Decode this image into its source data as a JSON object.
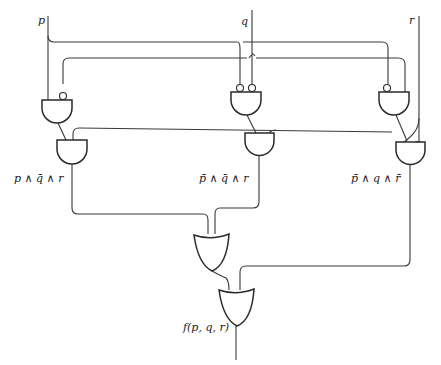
{
  "diagram": {
    "type": "logic-circuit",
    "inputs": [
      {
        "id": "p",
        "label": "p"
      },
      {
        "id": "q",
        "label": "q"
      },
      {
        "id": "r",
        "label": "r"
      }
    ],
    "gates": [
      {
        "id": "and1a",
        "type": "AND",
        "inputs": [
          "p",
          "not q"
        ]
      },
      {
        "id": "and1b",
        "type": "AND",
        "inputs": [
          "and1a",
          "r"
        ],
        "output_label": "p ∧ q̄ ∧ r"
      },
      {
        "id": "and2a",
        "type": "AND",
        "inputs": [
          "not p",
          "not q"
        ]
      },
      {
        "id": "and2b",
        "type": "AND",
        "inputs": [
          "and2a",
          "r"
        ],
        "output_label": "p̄ ∧ q̄ ∧ r"
      },
      {
        "id": "and3a",
        "type": "AND",
        "inputs": [
          "not p",
          "q"
        ]
      },
      {
        "id": "and3b",
        "type": "AND",
        "inputs": [
          "and3a",
          "not r"
        ],
        "output_label": "p̄ ∧ q ∧ r̄"
      },
      {
        "id": "or1",
        "type": "OR",
        "inputs": [
          "and1b",
          "and2b"
        ]
      },
      {
        "id": "or2",
        "type": "OR",
        "inputs": [
          "or1",
          "and3b"
        ],
        "output_label": "f(p, q, r)"
      }
    ]
  },
  "labels": {
    "p": "p",
    "q": "q",
    "r": "r",
    "term1": "p ∧ q̄ ∧ r",
    "term2": "p̄ ∧ q̄ ∧ r",
    "term3": "p̄ ∧ q ∧ r̄",
    "output": "f(p, q, r)"
  },
  "colors": {
    "stroke": "#2a2a2a",
    "background": "#ffffff"
  }
}
